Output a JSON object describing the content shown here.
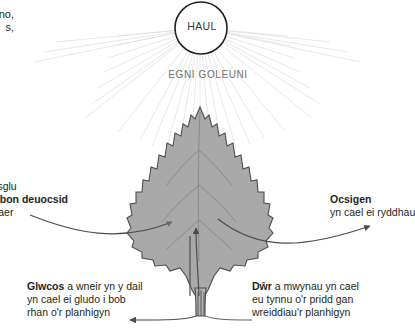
{
  "diagram": {
    "title_language": "cy",
    "sun": {
      "label": "HAUL",
      "icon": "sun-icon",
      "rays_label": "EGNI GOLEUNI",
      "ray_color": "#dcdcdc",
      "circle_color": "#231f20"
    },
    "clipped_note": {
      "line1": "no,",
      "line2": "s,"
    },
    "carbon_dioxide": {
      "line1": "Casglu",
      "line2_bold": "carbon deuocsid",
      "line3": "o'r aer"
    },
    "oxygen": {
      "line1_bold": "Ocsigen",
      "line2": "yn cael ei ryddhau"
    },
    "glucose": {
      "line1_bold": "Glwcos",
      "line1_rest": " a wneir yn y dail",
      "line2": "yn cael ei gludo i bob",
      "line3": "rhan o'r planhigyn"
    },
    "water": {
      "line1_bold": "Dŵr",
      "line1_rest": " a mwynau yn cael",
      "line2": "eu tynnu o'r pridd gan",
      "line3": "wreiddiau'r planhigyn"
    },
    "leaf": {
      "fill": "#a9a9a9",
      "stroke": "#4d4d4d",
      "name": "serrated-leaf-shape"
    },
    "arrows": {
      "co2_in": "carbon-dioxide-inflow-arrow",
      "oxygen_out": "oxygen-outflow-arrow",
      "water_up": "water-uptake-arrow",
      "glucose_out": "glucose-transport-arrow"
    }
  }
}
